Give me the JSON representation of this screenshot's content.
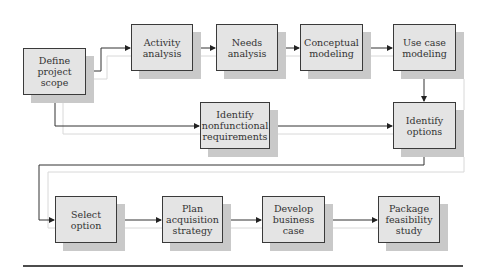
{
  "diagram": {
    "type": "flowchart",
    "nodes": [
      {
        "id": "define",
        "label": "Define project\nscope"
      },
      {
        "id": "activity",
        "label": "Activity\nanalysis"
      },
      {
        "id": "needs",
        "label": "Needs\nanalysis"
      },
      {
        "id": "conceptual",
        "label": "Conceptual\nmodeling"
      },
      {
        "id": "usecase",
        "label": "Use case\nmodeling"
      },
      {
        "id": "nonfunc",
        "label": "Identify\nnonfunctional\nrequirements"
      },
      {
        "id": "options",
        "label": "Identify\noptions"
      },
      {
        "id": "select",
        "label": "Select option"
      },
      {
        "id": "plan",
        "label": "Plan\nacquisition\nstrategy"
      },
      {
        "id": "develop",
        "label": "Develop\nbusiness\ncase"
      },
      {
        "id": "package",
        "label": "Package\nfeasibility\nstudy"
      }
    ],
    "edges": [
      [
        "define",
        "activity"
      ],
      [
        "activity",
        "needs"
      ],
      [
        "needs",
        "conceptual"
      ],
      [
        "conceptual",
        "usecase"
      ],
      [
        "usecase",
        "options"
      ],
      [
        "define",
        "nonfunc"
      ],
      [
        "nonfunc",
        "options"
      ],
      [
        "options",
        "select"
      ],
      [
        "select",
        "plan"
      ],
      [
        "plan",
        "develop"
      ],
      [
        "develop",
        "package"
      ]
    ],
    "colors": {
      "box_fill": "#e4e4e4",
      "box_border": "#3a3a3a",
      "shadow": "#c9c9c9",
      "line": "#333333",
      "ghost_line": "#d8d8d8"
    }
  }
}
